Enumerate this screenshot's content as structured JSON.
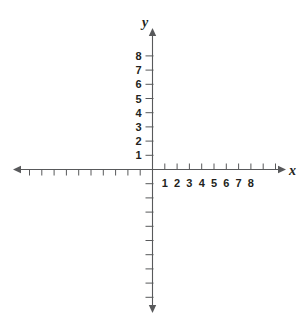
{
  "chart_data": {
    "type": "scatter",
    "title": "",
    "subtitle": "",
    "xlabel": "x",
    "ylabel": "y",
    "grid": false,
    "legend": null,
    "series": [],
    "x": [],
    "values": [],
    "xlim": [
      -11,
      10
    ],
    "ylim": [
      -10,
      9
    ],
    "x_tick_labels": [
      "1",
      "2",
      "3",
      "4",
      "5",
      "6",
      "7",
      "8"
    ],
    "x_tick_values": [
      1,
      2,
      3,
      4,
      5,
      6,
      7,
      8
    ],
    "y_tick_labels": [
      "1",
      "2",
      "3",
      "4",
      "5",
      "6",
      "7",
      "8"
    ],
    "y_tick_values": [
      1,
      2,
      3,
      4,
      5,
      6,
      7,
      8
    ],
    "x_unlabeled_tick_values": [
      -1,
      -2,
      -3,
      -4,
      -5,
      -6,
      -7,
      -8,
      -9,
      -10,
      9,
      10
    ],
    "y_unlabeled_tick_values": [
      -1,
      -2,
      -3,
      -4,
      -5,
      -6,
      -7,
      -8,
      -9
    ],
    "annotations": []
  },
  "axes": {
    "x_label": "x",
    "y_label": "y",
    "axis_color": "#58595b",
    "label_color": "#231f20",
    "background": "#ffffff"
  }
}
